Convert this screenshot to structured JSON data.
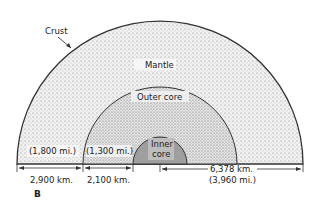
{
  "figure_label": "B",
  "layers": {
    "crust": "Crust",
    "mantle": "Mantle",
    "outer_core": "Outer core",
    "inner_core_line1": "Inner",
    "inner_core_line2": "core"
  },
  "dimensions": {
    "mantle_km": "2,900 km.",
    "mantle_mi": "(1,800 mi.)",
    "outer_core_km": "2,100 km.",
    "outer_core_mi": "(1,300 mi.)",
    "radius_km": "6,378 km.",
    "radius_mi": "(3,960 mi.)"
  },
  "colors": {
    "line": "#333333",
    "mantle_fill": "#e9e9e9",
    "outer_core_fill": "#dcdcdc",
    "inner_core_fill": "#9a9a9a"
  }
}
